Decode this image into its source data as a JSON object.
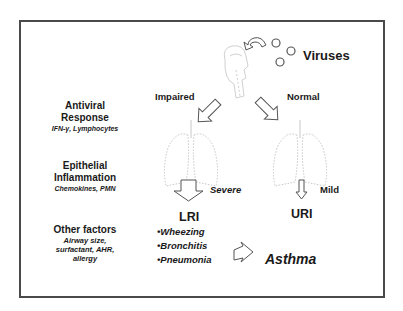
{
  "diagram": {
    "source_label": "Viruses",
    "branches": {
      "left": "Impaired",
      "right": "Normal"
    },
    "severity": {
      "left": "Severe",
      "right": "Mild"
    },
    "outcomes": {
      "left_title": "LRI",
      "left_items": [
        "•Wheezing",
        "•Bronchitis",
        "•Pneumonia"
      ],
      "right_title": "URI",
      "final": "Asthma"
    },
    "factors": [
      {
        "title_line1": "Antiviral",
        "title_line2": "Response",
        "detail_line1": "IFN-γ, Lymphocytes"
      },
      {
        "title_line1": "Epithelial",
        "title_line2": "Inflammation",
        "detail_line1": "Chemokines, PMN"
      },
      {
        "title_line1": "Other factors",
        "detail_line1": "Airway size,",
        "detail_line2": "surfactant, AHR,",
        "detail_line3": "allergy"
      }
    ],
    "colors": {
      "frame": "#4a4a4a",
      "text": "#1a1a1a",
      "illustration": "#c8c8c8",
      "arrow_outline": "#555555"
    }
  }
}
